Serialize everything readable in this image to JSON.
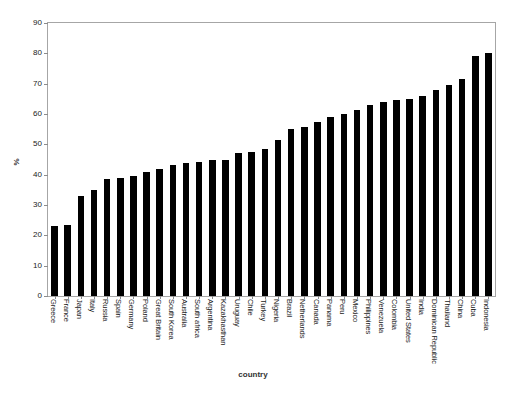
{
  "figure": {
    "title": "",
    "background_color": "#ffffff",
    "bar_color": "#000000",
    "axis_color": "#a6a6a6"
  },
  "chart_data": {
    "type": "bar",
    "title": "",
    "xlabel": "country",
    "ylabel": "%",
    "ylim": [
      0,
      90
    ],
    "yticks": [
      0,
      10,
      20,
      30,
      40,
      50,
      60,
      70,
      80,
      90
    ],
    "grid": false,
    "legend": null,
    "orientation": "vertical",
    "categories": [
      "Greece",
      "France",
      "Japan",
      "Italy",
      "Russia",
      "Spain",
      "Germany",
      "Poland",
      "Great Britain",
      "South Korea",
      "Australia",
      "South africa",
      "Argentina",
      "Kazakhasthan",
      "Uruguay",
      "Chile",
      "Turkey",
      "Nigeria",
      "Brazil",
      "Netherlands",
      "Canada",
      "Panama",
      "Peru",
      "Mexico",
      "Philippines",
      "Venezuela",
      "Colombia",
      "United States",
      "India",
      "Dominican Republic",
      "Thailand",
      "China",
      "Cuba",
      "Indonesia"
    ],
    "values": [
      23.0,
      23.3,
      33.0,
      35.0,
      38.5,
      39.0,
      39.7,
      40.8,
      42.0,
      43.3,
      44.0,
      44.3,
      44.7,
      45.0,
      47.3,
      47.5,
      48.5,
      51.5,
      55.0,
      55.7,
      57.5,
      59.0,
      60.0,
      61.3,
      63.0,
      64.0,
      64.5,
      65.0,
      66.0,
      68.0,
      69.5,
      71.5,
      79.0,
      80.0
    ]
  }
}
